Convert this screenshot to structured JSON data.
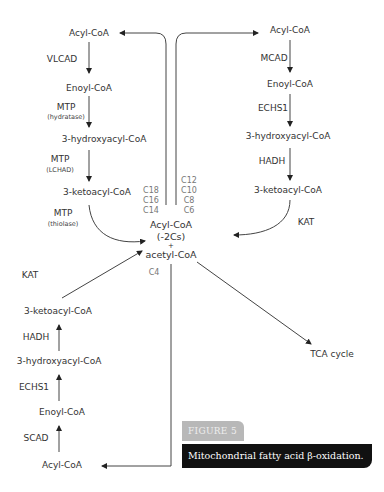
{
  "diagram": {
    "left_top_pathway": {
      "metabolites": [
        "Acyl-CoA",
        "Enoyl-CoA",
        "3-hydroxyacyl-CoA",
        "3-ketoacyl-CoA"
      ],
      "enzymes": [
        {
          "name": "VLCAD",
          "sub": ""
        },
        {
          "name": "MTP",
          "sub": "(hydratase)"
        },
        {
          "name": "MTP",
          "sub": "(LCHAD)"
        },
        {
          "name": "MTP",
          "sub": "(thiolase)"
        }
      ]
    },
    "right_top_pathway": {
      "metabolites": [
        "Acyl-CoA",
        "Enoyl-CoA",
        "3-hydroxyacyl-CoA",
        "3-ketoacyl-CoA"
      ],
      "enzymes": [
        "MCAD",
        "ECHS1",
        "HADH",
        "KAT"
      ]
    },
    "bottom_left_pathway": {
      "metabolites": [
        "3-ketoacyl-CoA",
        "3-hydroxyacyl-CoA",
        "Enoyl-CoA",
        "Acyl-CoA"
      ],
      "enzymes": [
        "KAT",
        "HADH",
        "ECHS1",
        "SCAD"
      ]
    },
    "center": {
      "line1": "Acyl-CoA",
      "line2": "(-2Cs)",
      "plus": "+",
      "line3": "acetyl-CoA"
    },
    "chain_lengths_left": [
      "C18",
      "C16",
      "C14"
    ],
    "chain_lengths_right": [
      "C12",
      "C10",
      "C8",
      "C6"
    ],
    "chain_length_bottom": "C4",
    "output": "TCA cycle"
  },
  "figure": {
    "tab_label": "FIGURE 5",
    "caption": "Mitochondrial fatty acid β-oxidation."
  },
  "colors": {
    "line": "#333333",
    "tab_bg": "#b8b8b8",
    "caption_bg": "#111111"
  }
}
